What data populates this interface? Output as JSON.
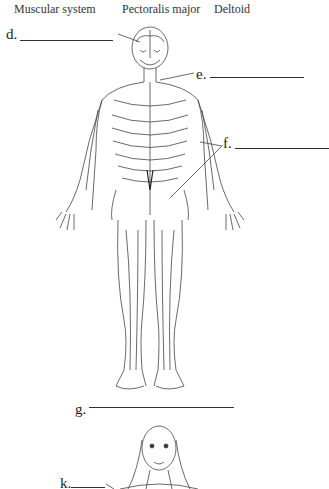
{
  "word_bank": [
    "Muscular system",
    "Pectoralis major",
    "Deltoid"
  ],
  "labels": {
    "d": "d.",
    "e": "e.",
    "f": "f.",
    "g": "g.",
    "k": "k."
  },
  "figures": {
    "body": "nervous-system-full-body-illustration",
    "head": "facial-muscles-head-illustration"
  }
}
